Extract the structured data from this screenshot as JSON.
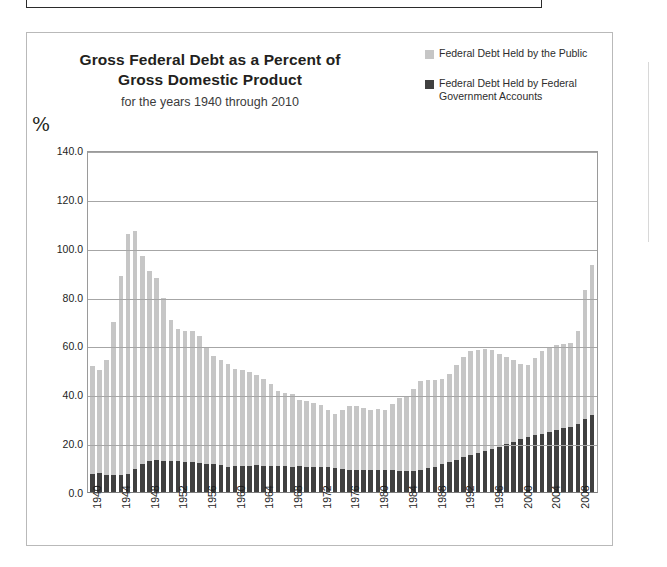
{
  "figure": {
    "title_line1": "Gross  Federal Debt as a Percent of",
    "title_line2": "Gross Domestic Product",
    "subtitle": "for the years 1940 through 2010",
    "percent_symbol": "%"
  },
  "legend": {
    "position": "top-right",
    "items": [
      {
        "label": "Federal Debt Held by the Public",
        "color": "#c6c6c6"
      },
      {
        "label": "Federal Debt Held by Federal Government Accounts",
        "color": "#404040"
      }
    ]
  },
  "chart_data": {
    "type": "bar",
    "stacked": true,
    "title": "Gross  Federal Debt as a Percent of Gross Domestic Product",
    "subtitle": "for the years 1940 through 2010",
    "xlabel": "",
    "ylabel": "%",
    "ylim": [
      0.0,
      140.0
    ],
    "yticks": [
      "0.0",
      "20.0",
      "40.0",
      "60.0",
      "80.0",
      "100.0",
      "120.0",
      "140.0"
    ],
    "ytick_values": [
      0,
      20,
      40,
      60,
      80,
      100,
      120,
      140
    ],
    "grid": true,
    "legend_position": "top-right",
    "xticks": [
      "1940",
      "1944",
      "1948",
      "1952",
      "1956",
      "1960",
      "1964",
      "1968",
      "1972",
      "1976",
      "1980",
      "1984",
      "1988",
      "1992",
      "1996",
      "2000",
      "2004",
      "2008"
    ],
    "xtick_step": 4,
    "categories": [
      1940,
      1941,
      1942,
      1943,
      1944,
      1945,
      1946,
      1947,
      1948,
      1949,
      1950,
      1951,
      1952,
      1953,
      1954,
      1955,
      1956,
      1957,
      1958,
      1959,
      1960,
      1961,
      1962,
      1963,
      1964,
      1965,
      1966,
      1967,
      1968,
      1969,
      1970,
      1971,
      1972,
      1973,
      1974,
      1975,
      1976,
      1977,
      1978,
      1979,
      1980,
      1981,
      1982,
      1983,
      1984,
      1985,
      1986,
      1987,
      1988,
      1989,
      1990,
      1991,
      1992,
      1993,
      1994,
      1995,
      1996,
      1997,
      1998,
      1999,
      2000,
      2001,
      2002,
      2003,
      2004,
      2005,
      2006,
      2007,
      2008,
      2009,
      2010
    ],
    "series": [
      {
        "name": "Federal Debt Held by Federal Government Accounts",
        "color": "#404040",
        "values": [
          7.5,
          7.6,
          7.0,
          6.8,
          6.9,
          7.5,
          9.3,
          11.5,
          12.8,
          13.0,
          12.6,
          12.8,
          12.5,
          12.1,
          12.2,
          11.8,
          11.6,
          11.4,
          10.9,
          10.4,
          10.5,
          10.6,
          10.7,
          10.9,
          10.8,
          10.5,
          10.5,
          10.7,
          10.3,
          10.5,
          10.4,
          10.2,
          10.3,
          10.1,
          9.8,
          9.3,
          8.9,
          9.1,
          9.1,
          9.1,
          9.2,
          9.0,
          8.9,
          8.6,
          8.5,
          8.7,
          9.2,
          9.9,
          10.4,
          11.3,
          12.2,
          13.1,
          14.2,
          15.0,
          15.9,
          16.8,
          17.6,
          18.5,
          19.6,
          20.6,
          21.6,
          22.5,
          23.3,
          23.8,
          24.5,
          25.4,
          26.2,
          26.8,
          27.7,
          29.9,
          31.5
        ]
      },
      {
        "name": "Federal Debt Held by the Public",
        "color": "#c6c6c6",
        "values": [
          44.2,
          42.2,
          47.0,
          62.8,
          81.5,
          98.0,
          97.6,
          85.1,
          77.8,
          74.7,
          67.0,
          57.6,
          54.4,
          53.7,
          53.7,
          51.9,
          47.5,
          44.2,
          43.3,
          42.0,
          39.9,
          39.5,
          38.5,
          37.0,
          35.5,
          33.6,
          30.9,
          29.8,
          30.0,
          27.3,
          26.7,
          26.4,
          25.4,
          23.5,
          22.2,
          24.1,
          26.2,
          26.3,
          25.5,
          24.3,
          24.8,
          24.7,
          27.1,
          29.7,
          30.7,
          33.3,
          36.1,
          36.0,
          35.6,
          34.9,
          36.1,
          38.9,
          41.2,
          42.6,
          42.4,
          41.9,
          40.5,
          38.2,
          35.7,
          33.3,
          30.9,
          29.4,
          31.5,
          33.8,
          34.5,
          34.6,
          34.4,
          34.4,
          38.4,
          52.9,
          61.3
        ]
      }
    ],
    "totals": [
      51.7,
      49.8,
      54.0,
      69.6,
      88.4,
      105.5,
      106.9,
      96.6,
      90.6,
      87.7,
      79.6,
      70.4,
      66.9,
      65.8,
      65.9,
      63.7,
      59.1,
      55.6,
      54.2,
      52.4,
      50.4,
      50.1,
      49.2,
      47.9,
      46.3,
      44.1,
      41.4,
      40.5,
      40.3,
      37.8,
      37.1,
      36.6,
      35.7,
      33.6,
      32.0,
      33.4,
      35.1,
      35.4,
      34.6,
      33.4,
      34.0,
      33.7,
      36.0,
      38.3,
      39.2,
      42.0,
      45.3,
      45.9,
      46.0,
      46.2,
      48.3,
      52.0,
      55.4,
      57.6,
      58.3,
      58.7,
      58.1,
      56.7,
      55.3,
      53.9,
      52.5,
      51.9,
      54.8,
      57.6,
      59.0,
      60.0,
      60.6,
      61.2,
      66.1,
      82.8,
      92.8
    ]
  }
}
